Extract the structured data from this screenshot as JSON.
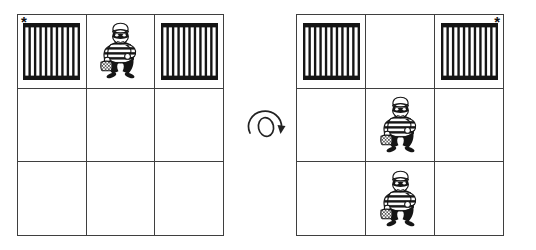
{
  "figure": {
    "background_color": "#ffffff",
    "grid_line_color": "#3f3f3f",
    "ink_color": "#151515",
    "asterisk": "*",
    "icons": {
      "jail_bars": "jail-bars-icon",
      "burglar": "burglar-icon",
      "rotate": "rotate-clockwise-icon"
    },
    "rotation": {
      "icon": "rotate-clockwise-icon"
    },
    "grids": [
      {
        "id": "before",
        "rows": 3,
        "cols": 3,
        "cells": [
          {
            "row": 0,
            "col": 0,
            "content": "jail-bars",
            "marker": "*",
            "marker_corner": "top-left"
          },
          {
            "row": 0,
            "col": 1,
            "content": "burglar"
          },
          {
            "row": 0,
            "col": 2,
            "content": "jail-bars"
          },
          {
            "row": 1,
            "col": 0,
            "content": "empty"
          },
          {
            "row": 1,
            "col": 1,
            "content": "empty"
          },
          {
            "row": 1,
            "col": 2,
            "content": "empty"
          },
          {
            "row": 2,
            "col": 0,
            "content": "empty"
          },
          {
            "row": 2,
            "col": 1,
            "content": "empty"
          },
          {
            "row": 2,
            "col": 2,
            "content": "empty"
          }
        ]
      },
      {
        "id": "after",
        "rows": 3,
        "cols": 3,
        "cells": [
          {
            "row": 0,
            "col": 0,
            "content": "jail-bars"
          },
          {
            "row": 0,
            "col": 1,
            "content": "empty"
          },
          {
            "row": 0,
            "col": 2,
            "content": "jail-bars",
            "marker": "*",
            "marker_corner": "top-right"
          },
          {
            "row": 1,
            "col": 0,
            "content": "empty"
          },
          {
            "row": 1,
            "col": 1,
            "content": "burglar"
          },
          {
            "row": 1,
            "col": 2,
            "content": "empty"
          },
          {
            "row": 2,
            "col": 0,
            "content": "empty"
          },
          {
            "row": 2,
            "col": 1,
            "content": "burglar"
          },
          {
            "row": 2,
            "col": 2,
            "content": "empty"
          }
        ]
      }
    ]
  }
}
